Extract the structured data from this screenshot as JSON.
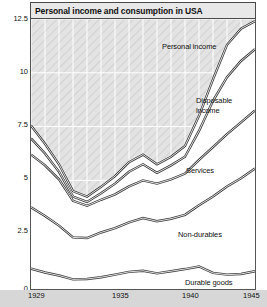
{
  "title": "Personal income and consumption in USA",
  "axes": {
    "ylabel": "Dollars (hundreds)",
    "yticks": [
      "12.5",
      "10",
      "7.5",
      "5",
      "2.5",
      "0"
    ],
    "ytick_values": [
      12.5,
      10,
      7.5,
      5,
      2.5,
      0
    ],
    "xticks": [
      "1929",
      "1935",
      "1940",
      "1945"
    ],
    "xtick_values": [
      1929,
      1935,
      1940,
      1945
    ]
  },
  "annotations": {
    "personal_income": "Personal income",
    "disposable_income_line1": "Disposable",
    "disposable_income_line2": "income",
    "services": "Services",
    "non_durables": "Non-durables",
    "durable_goods": "Durable goods"
  },
  "colors": {
    "band_line": "#3a3a3a",
    "plot_background": "#ffffff",
    "hatch_fill": "#dcdcdc",
    "gridline": "#ffffff",
    "frame": "#555555",
    "title_bar": "#e8e8e8",
    "axis_strip": "#d7d7d7"
  },
  "chart_data": {
    "type": "area",
    "title": "Personal income and consumption in USA",
    "xlabel": "",
    "ylabel": "Dollars (hundreds)",
    "xlim": [
      1929,
      1945
    ],
    "ylim": [
      0,
      12.5
    ],
    "grid": true,
    "legend": "inline-annotations",
    "stacked": false,
    "note": "Five cumulative curves plotted against year; bands between curves are the named categories. Values are dollars (hundreds).",
    "x": [
      1929,
      1930,
      1931,
      1932,
      1933,
      1934,
      1935,
      1936,
      1937,
      1938,
      1939,
      1940,
      1941,
      1942,
      1943,
      1944,
      1945
    ],
    "series": [
      {
        "name": "Durable goods",
        "label": "Durable goods",
        "values": [
          0.9,
          0.72,
          0.58,
          0.4,
          0.42,
          0.5,
          0.62,
          0.75,
          0.8,
          0.68,
          0.78,
          0.88,
          1.0,
          0.7,
          0.62,
          0.65,
          0.78
        ]
      },
      {
        "name": "Non-durables",
        "label": "Non-durables",
        "values": [
          3.75,
          3.35,
          2.9,
          2.35,
          2.32,
          2.58,
          2.78,
          3.05,
          3.25,
          3.1,
          3.22,
          3.4,
          3.85,
          4.25,
          4.72,
          5.1,
          5.55
        ]
      },
      {
        "name": "Services",
        "label": "Services",
        "values": [
          6.2,
          5.7,
          5.05,
          4.05,
          3.82,
          4.1,
          4.35,
          4.72,
          5.0,
          4.85,
          5.05,
          5.32,
          5.95,
          6.55,
          7.15,
          7.7,
          8.25
        ]
      },
      {
        "name": "Disposable income",
        "label": "Disposable income",
        "values": [
          6.95,
          6.25,
          5.4,
          4.25,
          4.0,
          4.4,
          4.85,
          5.4,
          5.75,
          5.35,
          5.7,
          6.1,
          7.3,
          8.7,
          9.8,
          10.55,
          11.1
        ]
      },
      {
        "name": "Personal income",
        "label": "Personal income",
        "values": [
          7.55,
          6.7,
          5.75,
          4.5,
          4.25,
          4.7,
          5.2,
          5.85,
          6.2,
          5.75,
          6.1,
          6.6,
          8.0,
          9.7,
          11.3,
          12.05,
          12.4
        ]
      }
    ]
  }
}
